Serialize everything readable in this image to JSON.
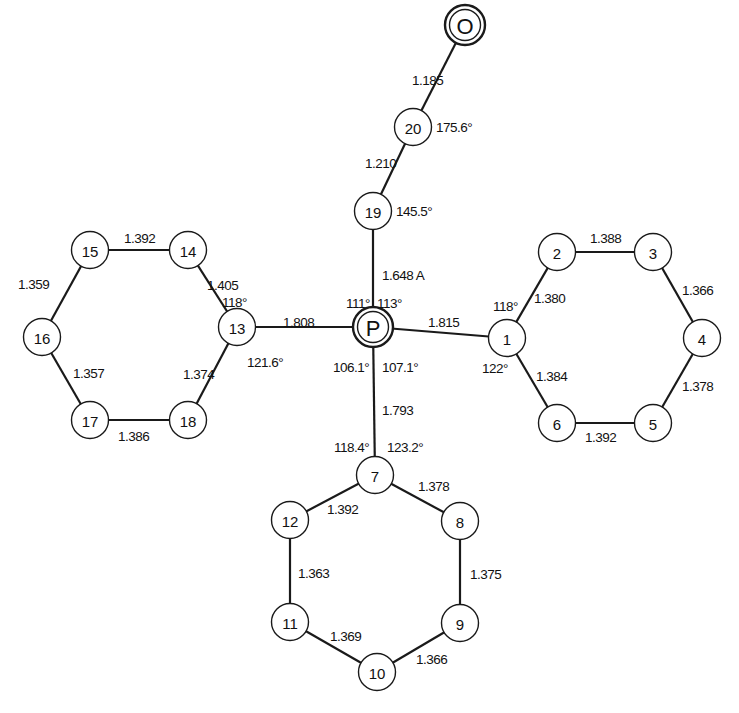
{
  "atoms": [
    {
      "id": "O",
      "label": "O",
      "x": 465,
      "y": 25,
      "style": "double"
    },
    {
      "id": "20",
      "label": "20",
      "x": 413,
      "y": 127,
      "style": "single"
    },
    {
      "id": "19",
      "label": "19",
      "x": 373,
      "y": 211,
      "style": "single"
    },
    {
      "id": "P",
      "label": "P",
      "x": 373,
      "y": 327,
      "style": "double"
    },
    {
      "id": "1",
      "label": "1",
      "x": 507,
      "y": 338,
      "style": "single"
    },
    {
      "id": "2",
      "label": "2",
      "x": 557,
      "y": 252,
      "style": "single"
    },
    {
      "id": "3",
      "label": "3",
      "x": 653,
      "y": 252,
      "style": "single"
    },
    {
      "id": "4",
      "label": "4",
      "x": 702,
      "y": 338,
      "style": "single"
    },
    {
      "id": "5",
      "label": "5",
      "x": 653,
      "y": 423,
      "style": "single"
    },
    {
      "id": "6",
      "label": "6",
      "x": 557,
      "y": 423,
      "style": "single"
    },
    {
      "id": "7",
      "label": "7",
      "x": 375,
      "y": 475,
      "style": "single"
    },
    {
      "id": "8",
      "label": "8",
      "x": 460,
      "y": 521,
      "style": "single"
    },
    {
      "id": "9",
      "label": "9",
      "x": 460,
      "y": 623,
      "style": "single"
    },
    {
      "id": "10",
      "label": "10",
      "x": 377,
      "y": 672,
      "style": "single"
    },
    {
      "id": "11",
      "label": "11",
      "x": 290,
      "y": 622,
      "style": "single"
    },
    {
      "id": "12",
      "label": "12",
      "x": 290,
      "y": 520,
      "style": "single"
    },
    {
      "id": "13",
      "label": "13",
      "x": 237,
      "y": 327,
      "style": "single"
    },
    {
      "id": "14",
      "label": "14",
      "x": 188,
      "y": 250,
      "style": "single"
    },
    {
      "id": "15",
      "label": "15",
      "x": 90,
      "y": 250,
      "style": "single"
    },
    {
      "id": "16",
      "label": "16",
      "x": 42,
      "y": 337,
      "style": "single"
    },
    {
      "id": "17",
      "label": "17",
      "x": 90,
      "y": 420,
      "style": "single"
    },
    {
      "id": "18",
      "label": "18",
      "x": 188,
      "y": 420,
      "style": "single"
    }
  ],
  "bonds": [
    {
      "from": "O",
      "to": "20",
      "length": "1.185",
      "lx": 412,
      "ly": 80
    },
    {
      "from": "20",
      "to": "19",
      "length": "1.210",
      "lx": 365,
      "ly": 163
    },
    {
      "from": "19",
      "to": "P",
      "length": "1.648 A",
      "lx": 382,
      "ly": 275
    },
    {
      "from": "P",
      "to": "13",
      "length": "1.808",
      "lx": 283,
      "ly": 322
    },
    {
      "from": "P",
      "to": "1",
      "length": "1.815",
      "lx": 428,
      "ly": 322
    },
    {
      "from": "P",
      "to": "7",
      "length": "1.793",
      "lx": 382,
      "ly": 410
    },
    {
      "from": "1",
      "to": "2",
      "length": "1.380",
      "lx": 534,
      "ly": 298
    },
    {
      "from": "2",
      "to": "3",
      "length": "1.388",
      "lx": 590,
      "ly": 238
    },
    {
      "from": "3",
      "to": "4",
      "length": "1.366",
      "lx": 682,
      "ly": 290
    },
    {
      "from": "4",
      "to": "5",
      "length": "1.378",
      "lx": 682,
      "ly": 386
    },
    {
      "from": "5",
      "to": "6",
      "length": "1.392",
      "lx": 585,
      "ly": 437
    },
    {
      "from": "6",
      "to": "1",
      "length": "1.384",
      "lx": 536,
      "ly": 376
    },
    {
      "from": "7",
      "to": "8",
      "length": "1.378",
      "lx": 418,
      "ly": 486
    },
    {
      "from": "8",
      "to": "9",
      "length": "1.375",
      "lx": 470,
      "ly": 574
    },
    {
      "from": "9",
      "to": "10",
      "length": "1.366",
      "lx": 416,
      "ly": 659
    },
    {
      "from": "10",
      "to": "11",
      "length": "1.369",
      "lx": 330,
      "ly": 636
    },
    {
      "from": "11",
      "to": "12",
      "length": "1.363",
      "lx": 298,
      "ly": 573
    },
    {
      "from": "12",
      "to": "7",
      "length": "1.392",
      "lx": 327,
      "ly": 509
    },
    {
      "from": "13",
      "to": "14",
      "length": "1.405",
      "lx": 207,
      "ly": 285
    },
    {
      "from": "14",
      "to": "15",
      "length": "1.392",
      "lx": 124,
      "ly": 238
    },
    {
      "from": "15",
      "to": "16",
      "length": "1.359",
      "lx": 18,
      "ly": 284
    },
    {
      "from": "16",
      "to": "17",
      "length": "1.357",
      "lx": 73,
      "ly": 373
    },
    {
      "from": "17",
      "to": "18",
      "length": "1.386",
      "lx": 118,
      "ly": 436
    },
    {
      "from": "18",
      "to": "13",
      "length": "1.374",
      "lx": 183,
      "ly": 374
    }
  ],
  "angles": [
    {
      "at": "20",
      "value": "175.6°",
      "lx": 436,
      "ly": 127
    },
    {
      "at": "19",
      "value": "145.5°",
      "lx": 396,
      "ly": 211
    },
    {
      "at": "P",
      "value": "111°",
      "lx": 346,
      "ly": 303
    },
    {
      "at": "P",
      "value": "113°",
      "lx": 377,
      "ly": 303
    },
    {
      "at": "P",
      "value": "106.1°",
      "lx": 333,
      "ly": 367
    },
    {
      "at": "P",
      "value": "107.1°",
      "lx": 382,
      "ly": 367
    },
    {
      "at": "1",
      "value": "118°",
      "lx": 493,
      "ly": 306
    },
    {
      "at": "1",
      "value": "122°",
      "lx": 482,
      "ly": 368
    },
    {
      "at": "13",
      "value": "118°",
      "lx": 222,
      "ly": 302
    },
    {
      "at": "13",
      "value": "121.6°",
      "lx": 247,
      "ly": 362
    },
    {
      "at": "7",
      "value": "118.4°",
      "lx": 334,
      "ly": 447
    },
    {
      "at": "7",
      "value": "123.2°",
      "lx": 387,
      "ly": 447
    }
  ],
  "colors": {
    "line": "#1a1a1a",
    "background": "#ffffff"
  }
}
